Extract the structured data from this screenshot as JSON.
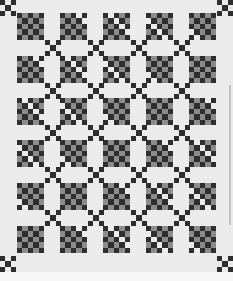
{
  "image": {
    "subject": "Irish chain style quilt photograph",
    "layout": {
      "block_columns": 5,
      "block_rows": 6,
      "block_cells": 5
    },
    "block_origins_x": [
      17,
      60,
      103,
      146,
      189
    ],
    "block_origins_y": [
      13,
      56,
      98,
      140,
      183,
      226
    ],
    "connector_origins": [
      [
        0,
        0
      ],
      [
        217,
        0
      ],
      [
        45,
        40
      ],
      [
        88,
        40
      ],
      [
        131,
        40
      ],
      [
        174,
        40
      ],
      [
        45,
        83
      ],
      [
        88,
        83
      ],
      [
        131,
        83
      ],
      [
        174,
        83
      ],
      [
        45,
        125
      ],
      [
        88,
        125
      ],
      [
        131,
        125
      ],
      [
        174,
        125
      ],
      [
        45,
        167
      ],
      [
        88,
        167
      ],
      [
        131,
        167
      ],
      [
        174,
        167
      ],
      [
        45,
        210
      ],
      [
        88,
        210
      ],
      [
        131,
        210
      ],
      [
        174,
        210
      ],
      [
        0,
        256
      ],
      [
        217,
        256
      ]
    ],
    "colors": {
      "background": "#ebebeb",
      "dark": "#2e2e2e",
      "medium": "#8c8c8c"
    }
  }
}
